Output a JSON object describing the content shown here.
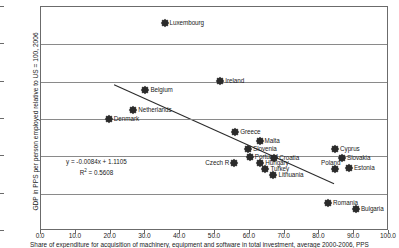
{
  "chart_data": {
    "type": "scatter",
    "title": "",
    "xlabel": "Share of expenditure for acquisition of machinery, equipment and software in total investment, average 2000-2006, PPS",
    "ylabel": "GDP in PPS per person employed relative to US = 100, 2006",
    "xlim": [
      0.0,
      100.0
    ],
    "ylim": [
      0.15,
      1.35
    ],
    "xticks": [
      "0.0",
      "10.0",
      "20.0",
      "30.0",
      "40.0",
      "50.0",
      "60.0",
      "70.0",
      "80.0",
      "90.0",
      "100.0"
    ],
    "yticks": [
      "0.15",
      "0.35",
      "0.55",
      "0.75",
      "0.95",
      "1.15",
      "1.35"
    ],
    "grid": true,
    "legend": "none",
    "marker_color": "#2b2b2b",
    "trendline_color": "#2b2b2b",
    "gridline_color": "#8a8a8a",
    "annotations": {
      "equation": "y = -0.0084x + 1.1105",
      "r_squared_prefix": "R",
      "r_squared_exp": "2",
      "r_squared_value": " = 0.5608"
    },
    "trendline": {
      "slope": -0.0084,
      "intercept": 1.1105,
      "x_start": 21.0,
      "y_start": 0.934,
      "x_end": 84.2,
      "y_end": 0.403
    },
    "points": [
      {
        "name": "Luxembourg",
        "x": 35.5,
        "y": 1.265,
        "label_side": "right"
      },
      {
        "name": "Ireland",
        "x": 51.5,
        "y": 0.955,
        "label_side": "right"
      },
      {
        "name": "Belgium",
        "x": 30.0,
        "y": 0.905,
        "label_side": "right"
      },
      {
        "name": "Netherlands",
        "x": 26.5,
        "y": 0.8,
        "label_side": "right"
      },
      {
        "name": "Denmark",
        "x": 19.5,
        "y": 0.752,
        "label_side": "right"
      },
      {
        "name": "Greece",
        "x": 55.8,
        "y": 0.68,
        "label_side": "right"
      },
      {
        "name": "Malta",
        "x": 62.8,
        "y": 0.632,
        "label_side": "right"
      },
      {
        "name": "Slovenia",
        "x": 59.5,
        "y": 0.588,
        "label_side": "right"
      },
      {
        "name": "Cyprus",
        "x": 84.5,
        "y": 0.59,
        "label_side": "right"
      },
      {
        "name": "Portugal",
        "x": 60.0,
        "y": 0.545,
        "label_side": "right"
      },
      {
        "name": "Croatia",
        "x": 67.0,
        "y": 0.54,
        "label_side": "right"
      },
      {
        "name": "Slovakia",
        "x": 86.5,
        "y": 0.54,
        "label_side": "right"
      },
      {
        "name": "Czech R",
        "x": 55.5,
        "y": 0.512,
        "label_side": "left"
      },
      {
        "name": "Hungary",
        "x": 63.0,
        "y": 0.512,
        "label_side": "right"
      },
      {
        "name": "Poland",
        "x": 84.5,
        "y": 0.482,
        "label_side": "top"
      },
      {
        "name": "Estonia",
        "x": 88.5,
        "y": 0.49,
        "label_side": "right"
      },
      {
        "name": "Turkey",
        "x": 64.5,
        "y": 0.482,
        "label_side": "right"
      },
      {
        "name": "Lithuania",
        "x": 66.8,
        "y": 0.452,
        "label_side": "right"
      },
      {
        "name": "Romania",
        "x": 82.5,
        "y": 0.298,
        "label_side": "right"
      },
      {
        "name": "Bulgaria",
        "x": 90.5,
        "y": 0.268,
        "label_side": "right"
      }
    ]
  }
}
